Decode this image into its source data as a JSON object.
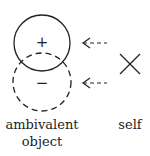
{
  "diagram": {
    "object_label_line1": "ambivalent",
    "object_label_line2": "object",
    "self_label": "self",
    "positive_sign": "+",
    "negative_sign": "−",
    "arrow_top": "←---",
    "arrow_bottom": "←---",
    "self_mark": "×"
  }
}
